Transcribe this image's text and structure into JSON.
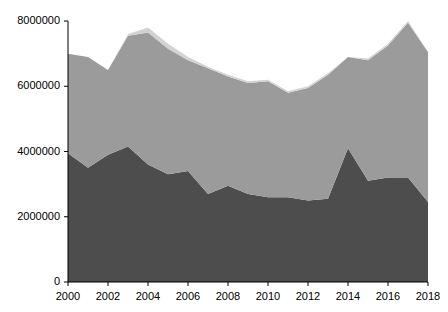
{
  "chart_data": {
    "type": "area",
    "stacked": true,
    "title": "",
    "subtitle": "",
    "xlabel": "",
    "ylabel": "",
    "grid": false,
    "legend_position": "none",
    "x": [
      2000,
      2001,
      2002,
      2003,
      2004,
      2005,
      2006,
      2007,
      2008,
      2009,
      2010,
      2011,
      2012,
      2013,
      2014,
      2015,
      2016,
      2017,
      2018
    ],
    "xlim": [
      2000,
      2018
    ],
    "ylim": [
      0,
      8000000
    ],
    "xtick_labels": [
      "2000",
      "2002",
      "2004",
      "2006",
      "2008",
      "2010",
      "2012",
      "2014",
      "2016",
      "2018"
    ],
    "xtick_values": [
      2000,
      2002,
      2004,
      2006,
      2008,
      2010,
      2012,
      2014,
      2016,
      2018
    ],
    "ytick_labels": [
      "0",
      "2000000",
      "4000000",
      "6000000",
      "8000000"
    ],
    "ytick_values": [
      0,
      2000000,
      4000000,
      6000000,
      8000000
    ],
    "series": [
      {
        "name": "series-1",
        "color": "#4d4d4d",
        "values": [
          3950000,
          3500000,
          3900000,
          4150000,
          3600000,
          3300000,
          3400000,
          2700000,
          2950000,
          2700000,
          2600000,
          2600000,
          2500000,
          2550000,
          4100000,
          3100000,
          3200000,
          3200000,
          2450000
        ]
      },
      {
        "name": "series-2",
        "color": "#9b9b9b",
        "values": [
          3050000,
          3400000,
          2600000,
          3400000,
          4050000,
          3850000,
          3400000,
          3850000,
          3350000,
          3400000,
          3550000,
          3200000,
          3450000,
          3800000,
          2800000,
          3700000,
          4050000,
          4750000,
          4600000
        ]
      },
      {
        "name": "series-3",
        "color": "#d2d2d2",
        "values": [
          0,
          0,
          0,
          50000,
          150000,
          150000,
          100000,
          50000,
          50000,
          50000,
          50000,
          50000,
          50000,
          50000,
          0,
          50000,
          50000,
          50000,
          0
        ]
      }
    ],
    "totals": [
      7000000,
      6900000,
      6500000,
      7600000,
      7800000,
      7300000,
      6900000,
      6600000,
      6350000,
      6150000,
      6200000,
      5850000,
      6000000,
      6400000,
      6900000,
      6850000,
      7300000,
      8000000,
      7050000
    ]
  },
  "axes": {
    "y_axis_name": "y-axis",
    "x_axis_name": "x-axis"
  }
}
